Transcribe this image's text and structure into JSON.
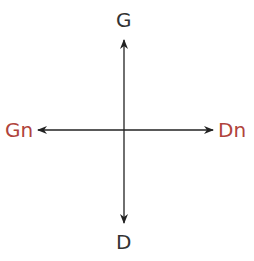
{
  "labels": {
    "top": "G",
    "bottom": "D",
    "left": "Gn",
    "right": "Dn"
  },
  "colors": {
    "axis_label": "#333333",
    "accent_label": "#b0443c",
    "arrow": "#222222"
  }
}
